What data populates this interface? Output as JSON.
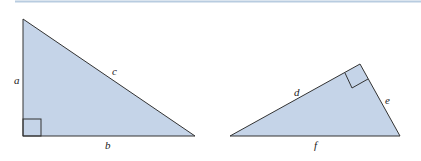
{
  "diagram": {
    "fill_color": "#c5d4e8",
    "stroke_color": "#333333",
    "rule_color": "#b8cce0",
    "triangles": [
      {
        "name": "left-triangle",
        "labels": {
          "a": "a",
          "b": "b",
          "c": "c"
        },
        "right_angle": "bottom-left"
      },
      {
        "name": "right-triangle",
        "labels": {
          "d": "d",
          "e": "e",
          "f": "f"
        },
        "right_angle": "top"
      }
    ]
  }
}
